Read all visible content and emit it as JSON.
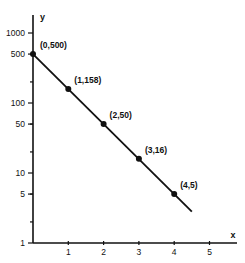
{
  "chart_data": {
    "type": "line",
    "title": "",
    "xlabel": "x",
    "ylabel": "y",
    "yscale": "log",
    "xlim": [
      0,
      5.6
    ],
    "ylim": [
      1,
      1500
    ],
    "grid": false,
    "x_ticks": [
      "1",
      "2",
      "3",
      "4",
      "5"
    ],
    "y_ticks": [
      "1",
      "5",
      "10",
      "50",
      "100",
      "500",
      "1000"
    ],
    "series": [
      {
        "name": "y",
        "x": [
          0,
          1,
          2,
          3,
          4
        ],
        "y": [
          500,
          158,
          50,
          16,
          5
        ],
        "labels": [
          "(0,500)",
          "(1,158)",
          "(2,50)",
          "(3,16)",
          "(4,5)"
        ]
      }
    ],
    "line_extends_to_x": 4.5
  }
}
